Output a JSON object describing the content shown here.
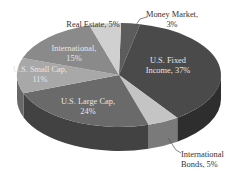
{
  "chart_data": {
    "type": "pie",
    "style": "3d",
    "title": "",
    "start_slice": "Money Market",
    "direction": "clockwise",
    "slices": [
      {
        "label": "Money Market",
        "value": 3,
        "color": "#5c5c5c",
        "label_lines": [
          "Money Market,",
          "3%"
        ],
        "label_position": "outside"
      },
      {
        "label": "U.S. Fixed Income",
        "value": 37,
        "color": "#4a4a4a",
        "label_lines": [
          "U.S. Fixed",
          "Income, 37%"
        ],
        "label_position": "inside"
      },
      {
        "label": "International Bonds",
        "value": 5,
        "color": "#c4c4c4",
        "label_lines": [
          "International",
          "Bonds, 5%"
        ],
        "label_position": "outside"
      },
      {
        "label": "U.S. Large Cap",
        "value": 24,
        "color": "#6a6a6a",
        "label_lines": [
          "U.S. Large Cap,",
          "24%"
        ],
        "label_position": "inside"
      },
      {
        "label": "U.S. Small Cap",
        "value": 11,
        "color": "#a8a8a8",
        "label_lines": [
          "U.S. Small Cap,",
          "11%"
        ],
        "label_position": "inside"
      },
      {
        "label": "International",
        "value": 15,
        "color": "#8a8a8a",
        "label_lines": [
          "International,",
          "15%"
        ],
        "label_position": "inside"
      },
      {
        "label": "Real Estate",
        "value": 5,
        "color": "#d0d0d0",
        "label_lines": [
          "Real Estate, 5%"
        ],
        "label_position": "outside"
      }
    ]
  }
}
